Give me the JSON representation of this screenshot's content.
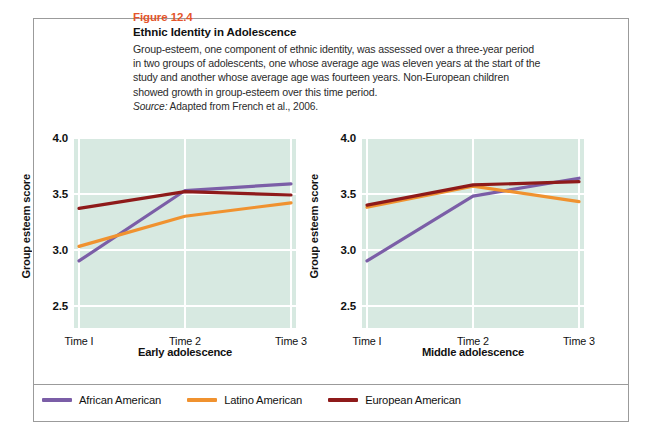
{
  "figure": {
    "number": "Figure 12.4",
    "title": "Ethnic Identity in Adolescence",
    "description": "Group-esteem, one component of ethnic identity, was assessed over a three-year period in two groups of adolescents, one whose average age was eleven years at the start of the study and another whose average age was fourteen years. Non-European children showed growth in group-esteem over this time period.",
    "source_label": "Source:",
    "source_text": "Adapted from French et al., 2006."
  },
  "colors": {
    "figure_number": "#e4552b",
    "plot_background": "#d7e9e1",
    "gridline": "#ffffff",
    "frame_border": "#9b9b9b",
    "african_american": "#7b5ea7",
    "latino_american": "#f0922f",
    "european_american": "#8e1a1a"
  },
  "legend": {
    "items": [
      {
        "label": "African American",
        "color": "#7b5ea7"
      },
      {
        "label": "Latino American",
        "color": "#f0922f"
      },
      {
        "label": "European American",
        "color": "#8e1a1a"
      }
    ]
  },
  "chart_data": [
    {
      "type": "line",
      "title": "Early adolescence",
      "xlabel": "Early adolescence",
      "ylabel": "Group esteem score",
      "categories": [
        "Time I",
        "Time 2",
        "Time 3"
      ],
      "x_tick_labels": [
        "Time I",
        "Time 2",
        "Time 3"
      ],
      "y_tick_labels": [
        "4.0",
        "3.5",
        "3.0",
        "2.5"
      ],
      "y_ticks": [
        4.0,
        3.5,
        3.0,
        2.5
      ],
      "ylim": [
        2.3,
        4.0
      ],
      "grid": true,
      "legend_position": "bottom",
      "series": [
        {
          "name": "African American",
          "color": "#7b5ea7",
          "values": [
            2.9,
            3.53,
            3.59
          ]
        },
        {
          "name": "Latino American",
          "color": "#f0922f",
          "values": [
            3.03,
            3.3,
            3.42
          ]
        },
        {
          "name": "European American",
          "color": "#8e1a1a",
          "values": [
            3.37,
            3.52,
            3.49
          ]
        }
      ]
    },
    {
      "type": "line",
      "title": "Middle adolescence",
      "xlabel": "Middle adolescence",
      "ylabel": "Group esteem score",
      "categories": [
        "Time I",
        "Time 2",
        "Time 3"
      ],
      "x_tick_labels": [
        "Time I",
        "Time 2",
        "Time 3"
      ],
      "y_tick_labels": [
        "4.0",
        "3.5",
        "3.0",
        "2.5"
      ],
      "y_ticks": [
        4.0,
        3.5,
        3.0,
        2.5
      ],
      "ylim": [
        2.3,
        4.0
      ],
      "grid": true,
      "legend_position": "bottom",
      "series": [
        {
          "name": "African American",
          "color": "#7b5ea7",
          "values": [
            2.9,
            3.48,
            3.64
          ]
        },
        {
          "name": "Latino American",
          "color": "#f0922f",
          "values": [
            3.38,
            3.57,
            3.43
          ]
        },
        {
          "name": "European American",
          "color": "#8e1a1a",
          "values": [
            3.4,
            3.58,
            3.61
          ]
        }
      ]
    }
  ]
}
